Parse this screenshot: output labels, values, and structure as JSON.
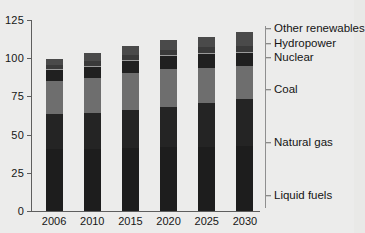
{
  "chart_data": {
    "type": "bar",
    "subtype": "stacked-vertical",
    "title": "",
    "xlabel": "",
    "ylabel": "",
    "ylim": [
      0,
      125
    ],
    "yticks": [
      0,
      25,
      50,
      75,
      100,
      125
    ],
    "grid": false,
    "legend_position": "right-bracket",
    "categories": [
      "2006",
      "2010",
      "2015",
      "2020",
      "2025",
      "2030"
    ],
    "series": [
      {
        "name": "Liquid fuels",
        "color": "#1d1d1d",
        "values": [
          40.6,
          40.7,
          41.5,
          41.8,
          42.2,
          42.7
        ]
      },
      {
        "name": "Natural gas",
        "color": "#242424",
        "values": [
          22.6,
          23.3,
          24.9,
          26.6,
          28.5,
          30.6
        ]
      },
      {
        "name": "Coal",
        "color": "#6e6e6e",
        "values": [
          21.7,
          22.8,
          23.9,
          24.4,
          23.2,
          21.7
        ]
      },
      {
        "name": "Nuclear",
        "color": "#202020",
        "values": [
          7.2,
          7.4,
          7.9,
          8.4,
          8.7,
          8.3
        ]
      },
      {
        "name": "Hydropower",
        "color": "#3a3a3a",
        "values": [
          3.5,
          3.9,
          4.1,
          4.4,
          4.6,
          4.6
        ]
      },
      {
        "name": "Other renewables",
        "color": "#4a4a4a",
        "values": [
          4.1,
          5.0,
          5.8,
          6.1,
          6.7,
          9.4
        ]
      }
    ],
    "totals": [
      99.7,
      103.1,
      108.1,
      111.7,
      113.9,
      117.3
    ],
    "legend": [
      {
        "label": "Other renewables"
      },
      {
        "label": "Hydropower"
      },
      {
        "label": "Nuclear"
      },
      {
        "label": "Coal"
      },
      {
        "label": "Natural gas"
      },
      {
        "label": "Liquid fuels"
      }
    ]
  },
  "axis": {
    "y_tick_labels": [
      "125",
      "100",
      "75",
      "50",
      "25",
      "0"
    ],
    "x_tick_labels": [
      "2006",
      "2010",
      "2015",
      "2020",
      "2025",
      "2030"
    ]
  }
}
